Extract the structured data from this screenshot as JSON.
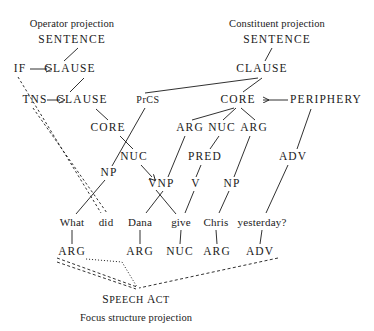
{
  "figure": {
    "sentence": "What did Dana give Chris yesterday?"
  },
  "captions": {
    "operator_projection": "Operator projection",
    "constituent_projection": "Constituent projection",
    "focus_structure_projection": "Focus structure projection"
  },
  "operator_projection": {
    "nodes": [
      {
        "id": "op-sentence",
        "label": "SENTENCE",
        "x": 72,
        "y": 40
      },
      {
        "id": "op-if",
        "label": "IF",
        "x": 20,
        "y": 69
      },
      {
        "id": "op-clause-1",
        "label": "CLAUSE",
        "x": 70,
        "y": 69
      },
      {
        "id": "op-tns",
        "label": "TNS",
        "x": 35,
        "y": 100
      },
      {
        "id": "op-clause-2",
        "label": "CLAUSE",
        "x": 82,
        "y": 100
      },
      {
        "id": "op-core",
        "label": "CORE",
        "x": 108,
        "y": 128
      },
      {
        "id": "op-nuc",
        "label": "NUC",
        "x": 134,
        "y": 157
      },
      {
        "id": "op-v",
        "label": "V",
        "x": 153,
        "y": 184
      }
    ]
  },
  "constituent_projection": {
    "nodes": [
      {
        "id": "cn-sentence",
        "label": "SENTENCE",
        "x": 277,
        "y": 40
      },
      {
        "id": "cn-clause",
        "label": "CLAUSE",
        "x": 262,
        "y": 69
      },
      {
        "id": "cn-prcs",
        "label": "PrCS",
        "x": 148,
        "y": 100
      },
      {
        "id": "cn-core",
        "label": "CORE",
        "x": 238,
        "y": 100
      },
      {
        "id": "cn-periphery",
        "label": "PERIPHERY",
        "x": 326,
        "y": 100
      },
      {
        "id": "cn-arg-1",
        "label": "ARG",
        "x": 190,
        "y": 128
      },
      {
        "id": "cn-nuc",
        "label": "NUC",
        "x": 222,
        "y": 128
      },
      {
        "id": "cn-arg-2",
        "label": "ARG",
        "x": 254,
        "y": 128
      },
      {
        "id": "cn-pred",
        "label": "PRED",
        "x": 205,
        "y": 157
      },
      {
        "id": "cn-adv",
        "label": "ADV",
        "x": 293,
        "y": 157
      },
      {
        "id": "cn-np-1",
        "label": "NP",
        "x": 109,
        "y": 173
      },
      {
        "id": "cn-np-2",
        "label": "NP",
        "x": 166,
        "y": 184
      },
      {
        "id": "cn-v",
        "label": "V",
        "x": 196,
        "y": 184
      },
      {
        "id": "cn-np-3",
        "label": "NP",
        "x": 232,
        "y": 184
      }
    ]
  },
  "words": [
    {
      "id": "word-what",
      "label": "What",
      "x": 72,
      "y": 222
    },
    {
      "id": "word-did",
      "label": "did",
      "x": 106,
      "y": 222
    },
    {
      "id": "word-dana",
      "label": "Dana",
      "x": 140,
      "y": 222
    },
    {
      "id": "word-give",
      "label": "give",
      "x": 181,
      "y": 222
    },
    {
      "id": "word-chris",
      "label": "Chris",
      "x": 216,
      "y": 222
    },
    {
      "id": "word-yesterday",
      "label": "yesterday?",
      "x": 262,
      "y": 222
    }
  ],
  "focus_projection": {
    "nodes": [
      {
        "id": "fs-arg-1",
        "label": "ARG",
        "x": 72,
        "y": 252
      },
      {
        "id": "fs-arg-2",
        "label": "ARG",
        "x": 140,
        "y": 252
      },
      {
        "id": "fs-nuc",
        "label": "NUC",
        "x": 180,
        "y": 252
      },
      {
        "id": "fs-arg-3",
        "label": "ARG",
        "x": 217,
        "y": 252
      },
      {
        "id": "fs-adv",
        "label": "ADV",
        "x": 260,
        "y": 252
      }
    ],
    "speech_act": {
      "label": "SPEECH ACT",
      "small_caps_parts": [
        "S",
        "PEECH ",
        "A",
        "CT"
      ],
      "x": 136,
      "y": 300
    }
  },
  "colors": {
    "ink": "#1a1a1a",
    "background": "#ffffff"
  }
}
